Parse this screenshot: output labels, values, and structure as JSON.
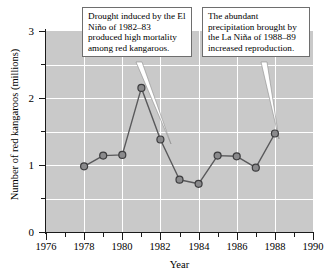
{
  "chart_data": {
    "type": "line",
    "title": "",
    "xlabel": "Year",
    "ylabel": "Number of red kangaroos (millions)",
    "xlim": [
      1976,
      1990
    ],
    "ylim": [
      0,
      3
    ],
    "grid": true,
    "legend": "none",
    "x": [
      1978,
      1979,
      1980,
      1981,
      1982,
      1983,
      1984,
      1985,
      1986,
      1987,
      1988
    ],
    "values": [
      0.98,
      1.14,
      1.15,
      2.15,
      1.38,
      0.78,
      0.72,
      1.14,
      1.13,
      0.96,
      1.47
    ],
    "series": [
      {
        "name": "Red kangaroo population",
        "values": [
          0.98,
          1.14,
          1.15,
          2.15,
          1.38,
          0.78,
          0.72,
          1.14,
          1.13,
          0.96,
          1.47
        ]
      }
    ],
    "x_ticks_major": [
      1976,
      1978,
      1980,
      1982,
      1984,
      1986,
      1988,
      1990
    ],
    "x_ticks_minor": [
      1977,
      1979,
      1981,
      1983,
      1985,
      1987,
      1989
    ],
    "y_ticks_major": [
      0,
      1,
      2,
      3
    ],
    "y_ticks_minor": [
      0.5,
      1.5,
      2.5
    ],
    "x_tick_labels": [
      "1976",
      "1978",
      "1980",
      "1982",
      "1984",
      "1986",
      "1988",
      "1990"
    ],
    "y_tick_labels": [
      "0",
      "1",
      "2",
      "3"
    ],
    "annotations": [
      {
        "id": "drought",
        "text": "Drought induced by the El Niño of 1982–83 produced high mortality among red kangaroos.",
        "points_to_year": 1983
      },
      {
        "id": "precipitation",
        "text": "The abundant precipitation brought by the La Niña of 1988–89 increased reproduction.",
        "points_to_year": 1988
      }
    ],
    "colors": {
      "plot_background": "#c9c9c9",
      "gridline": "#ffffff",
      "line": "#59595b",
      "marker_fill": "#8a8a8c",
      "marker_edge": "#3c3c3e",
      "axis": "#1a1a1a",
      "callout_background": "#ffffff",
      "callout_border": "#6e6e6e",
      "text": "#000000"
    }
  }
}
